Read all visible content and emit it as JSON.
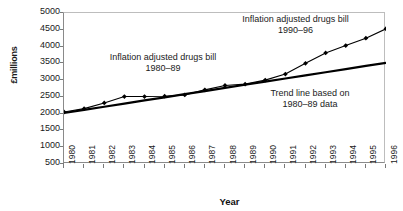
{
  "chart_data": {
    "type": "line",
    "title": "",
    "xlabel": "Year",
    "ylabel": "£millions",
    "xlim": [
      1980,
      1996
    ],
    "ylim": [
      500,
      5000
    ],
    "ytick_labels": [
      "5000",
      "4500",
      "4000",
      "3500",
      "3000",
      "2500",
      "2000",
      "1500",
      "1000",
      "500"
    ],
    "ytick_values": [
      5000,
      4500,
      4000,
      3500,
      3000,
      2500,
      2000,
      1500,
      1000,
      500
    ],
    "xtick_labels": [
      "1980",
      "1981",
      "1982",
      "1983",
      "1984",
      "1985",
      "1986",
      "1987",
      "1988",
      "1989",
      "1990",
      "1991",
      "1992",
      "1993",
      "1994",
      "1995",
      "1996"
    ],
    "x": [
      1980,
      1981,
      1982,
      1983,
      1984,
      1985,
      1986,
      1987,
      1988,
      1989,
      1990,
      1991,
      1992,
      1993,
      1994,
      1995,
      1996
    ],
    "grid": false,
    "legend": "none",
    "series": [
      {
        "name": "Inflation adjusted drugs bill",
        "marker": "diamond",
        "color": "#000000",
        "values": [
          2050,
          2150,
          2320,
          2510,
          2510,
          2520,
          2560,
          2710,
          2840,
          2880,
          3000,
          3180,
          3500,
          3810,
          4030,
          4250,
          4530
        ]
      },
      {
        "name": "Trend line based on 1980–89 data",
        "marker": "none",
        "color": "#000000",
        "values": [
          2020,
          2113,
          2207,
          2300,
          2394,
          2487,
          2581,
          2674,
          2768,
          2861,
          2955,
          3048,
          3142,
          3235,
          3329,
          3422,
          3516
        ]
      }
    ],
    "annotations": [
      {
        "id": "anno-a",
        "text": "Inflation adjusted drugs bill\n1980–89"
      },
      {
        "id": "anno-b",
        "text": "Inflation adjusted drugs bill\n1990–96"
      },
      {
        "id": "anno-c",
        "text": "Trend line based on\n1980–89 data"
      }
    ]
  }
}
